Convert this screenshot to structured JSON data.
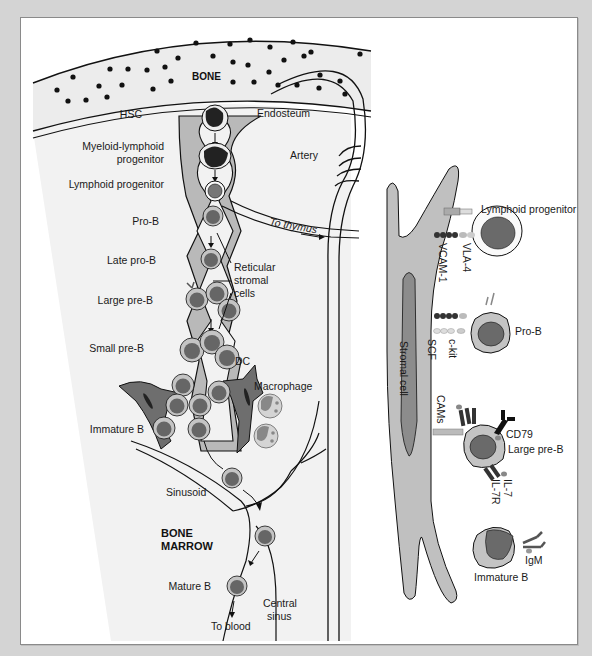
{
  "figure": {
    "left_panel": {
      "region_labels": {
        "bone": "BONE",
        "bone_marrow_line1": "BONE",
        "bone_marrow_line2": "MARROW"
      },
      "structures": {
        "endosteum": "Endosteum",
        "artery": "Artery",
        "to_thymus": "To thymus",
        "reticular_stromal_cells": [
          "Reticular",
          "stromal",
          "cells"
        ],
        "dc": "DC",
        "macrophage": "Macrophage",
        "sinusoid": "Sinusoid",
        "central_sinus": [
          "Central",
          "sinus"
        ],
        "to_blood": "To blood"
      },
      "stages": [
        {
          "label": [
            "HSC"
          ]
        },
        {
          "label": [
            "Myeloid-lymphoid",
            "progenitor"
          ]
        },
        {
          "label": [
            "Lymphoid progenitor"
          ]
        },
        {
          "label": [
            "Pro-B"
          ]
        },
        {
          "label": [
            "Late pro-B"
          ]
        },
        {
          "label": [
            "Large pre-B"
          ]
        },
        {
          "label": [
            "Small pre-B"
          ]
        },
        {
          "label": [
            "Immature B"
          ]
        },
        {
          "label": [
            "Mature B"
          ]
        }
      ]
    },
    "right_panel": {
      "stromal_cell": "Stromal cell",
      "cells": [
        {
          "label": "Lymphoid progenitor",
          "interactions": [
            "VCAM-1",
            "VLA-4"
          ]
        },
        {
          "label": "Pro-B",
          "interactions": [
            "SCF",
            "c-kit"
          ]
        },
        {
          "label": "Large pre-B",
          "interactions": [
            "CAMs",
            "CD79",
            "IL-7",
            "IL-7R"
          ]
        },
        {
          "label": "Immature B",
          "interactions": [
            "IgM"
          ]
        }
      ]
    },
    "colors": {
      "background": "#d4d4d4",
      "panel": "#ffffff",
      "bone_fill": "#ececec",
      "marrow_fill": "#f1f1f1",
      "stroma_gray": "#b8b8b8",
      "dc_dark": "#6e6e6e",
      "nucleus": "#6a6a6a",
      "cytoplasm": "#c4c4c4",
      "line": "#111111"
    }
  }
}
